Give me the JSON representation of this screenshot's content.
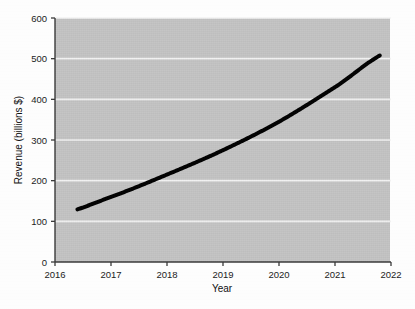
{
  "chart_data": {
    "type": "line",
    "title": "",
    "xlabel": "Year",
    "ylabel": "Revenue (billions $)",
    "x": [
      2016,
      2017,
      2018,
      2019,
      2020,
      2021,
      2022
    ],
    "categories": [
      "2016",
      "2017",
      "2018",
      "2019",
      "2020",
      "2021",
      "2022"
    ],
    "values": [
      115,
      160,
      215,
      275,
      345,
      430,
      520
    ],
    "series": [
      {
        "name": "Revenue",
        "values": [
          115,
          160,
          215,
          275,
          345,
          430,
          520
        ]
      }
    ],
    "xlim": [
      2016,
      2022
    ],
    "ylim": [
      0,
      600
    ],
    "yticks": [
      0,
      100,
      200,
      300,
      400,
      500,
      600
    ],
    "ytick_labels": [
      "0",
      "100",
      "200",
      "300",
      "400",
      "500",
      "600"
    ],
    "xticks": [
      2016,
      2017,
      2018,
      2019,
      2020,
      2021,
      2022
    ],
    "xtick_labels": [
      "2016",
      "2017",
      "2018",
      "2019",
      "2020",
      "2021",
      "2022"
    ],
    "grid": true,
    "grid_axis": "y",
    "grid_color": "#f2f2f2",
    "legend": false,
    "legend_position": "none",
    "line_color": "#000000",
    "line_width": 4,
    "plot_background": "#c4c4c4",
    "figure_background": "#fdfdfd",
    "axis_color": "#3a3a3a",
    "data_start_x": 2016.4,
    "data_start_y": 115,
    "data_end_x": 2021.8,
    "data_end_y": 518
  }
}
